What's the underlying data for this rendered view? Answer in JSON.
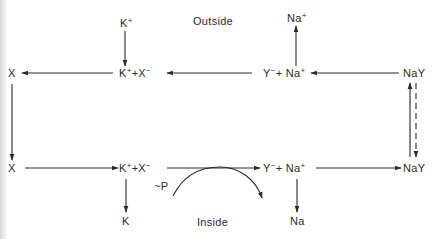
{
  "diagram": {
    "region_labels": {
      "outside": "Outside",
      "inside": "Inside"
    },
    "nodes": {
      "top_k_ion": {
        "base": "K",
        "charge": "+"
      },
      "top_na_ion": {
        "base": "Na",
        "charge": "+"
      },
      "top_x": {
        "base": "X"
      },
      "top_kx": {
        "k": "K",
        "k_charge": "+",
        "plus": "+",
        "x": "X",
        "x_charge": "−"
      },
      "top_yna": {
        "y": "Y",
        "y_charge": "−",
        "plus": "+",
        "na": "Na",
        "na_charge": "+"
      },
      "top_nay": {
        "base": "NaY"
      },
      "bottom_x": {
        "base": "X"
      },
      "bottom_kx": {
        "k": "K",
        "k_charge": "+",
        "plus": "+",
        "x": "X",
        "x_charge": "−"
      },
      "bottom_yna": {
        "y": "Y",
        "y_charge": "−",
        "plus": "+",
        "na": "Na",
        "na_charge": "+"
      },
      "bottom_nay": {
        "base": "NaY"
      },
      "bottom_k": {
        "base": "K"
      },
      "bottom_na": {
        "base": "Na"
      },
      "energy": {
        "base": "~P"
      }
    },
    "edges": [
      {
        "from": "K+ (outside)",
        "to": "K+ + X− (top)",
        "style": "solid"
      },
      {
        "from": "Y− + Na+ (top)",
        "to": "Na+ (outside)",
        "style": "solid"
      },
      {
        "from": "K+ + X− (top)",
        "to": "X (top)",
        "style": "solid"
      },
      {
        "from": "NaY (top)",
        "to": "Y− + Na+ (top)",
        "style": "solid"
      },
      {
        "from": "X (top)",
        "to": "X (bottom)",
        "style": "solid"
      },
      {
        "from": "X (bottom)",
        "to": "K+ + X− (bottom)",
        "style": "solid"
      },
      {
        "from": "K+ + X− (bottom)",
        "to": "Y− + Na+ (bottom)",
        "style": "solid"
      },
      {
        "from": "Y− + Na+ (bottom)",
        "to": "NaY (bottom)",
        "style": "solid"
      },
      {
        "from": "NaY (bottom)",
        "to": "NaY (top)",
        "style": "solid"
      },
      {
        "from": "NaY (top)",
        "to": "NaY (bottom)",
        "style": "dashed"
      },
      {
        "from": "K+ + X− (bottom)",
        "to": "K (inside)",
        "style": "solid"
      },
      {
        "from": "Y− + Na+ (bottom)",
        "to": "Na (inside)",
        "style": "solid"
      },
      {
        "from": "~P",
        "to": "curved energy coupling",
        "style": "curved"
      }
    ],
    "colors": {
      "ink": "#2a2a2a",
      "background": "#ffffff"
    }
  }
}
